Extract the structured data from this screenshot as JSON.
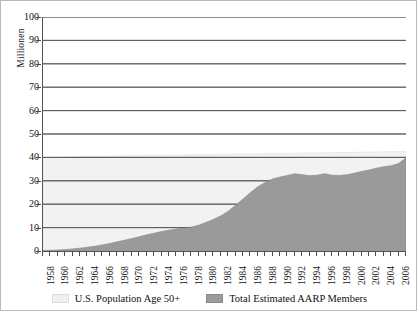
{
  "chart_data": {
    "type": "area",
    "title": "",
    "xlabel": "",
    "ylabel": "Millionen",
    "ylim": [
      0,
      100
    ],
    "xlim": [
      1958,
      2007
    ],
    "ytick_step": 10,
    "yticks": [
      0,
      10,
      20,
      30,
      40,
      50,
      60,
      70,
      80,
      90,
      100
    ],
    "xticks": [
      1958,
      1960,
      1962,
      1964,
      1966,
      1968,
      1970,
      1972,
      1974,
      1976,
      1978,
      1980,
      1982,
      1984,
      1986,
      1988,
      1990,
      1992,
      1994,
      1996,
      1998,
      2000,
      2002,
      2004,
      2006
    ],
    "xtick_labels": [
      "1958",
      "1960",
      "1962",
      "1964",
      "1966",
      "1968",
      "1970",
      "1972",
      "1974",
      "1976",
      "1978",
      "1980",
      "1982",
      "1984",
      "1986",
      "1988",
      "1990",
      "1992",
      "1994",
      "1996",
      "1998",
      "2000",
      "2002",
      "2004",
      "2006"
    ],
    "grid": "horizontal",
    "legend_position": "bottom",
    "x": [
      1958,
      1959,
      1960,
      1961,
      1962,
      1963,
      1964,
      1965,
      1966,
      1967,
      1968,
      1969,
      1970,
      1971,
      1972,
      1973,
      1974,
      1975,
      1976,
      1977,
      1978,
      1979,
      1980,
      1981,
      1982,
      1983,
      1984,
      1985,
      1986,
      1987,
      1988,
      1989,
      1990,
      1991,
      1992,
      1993,
      1994,
      1995,
      1996,
      1997,
      1998,
      1999,
      2000,
      2001,
      2002,
      2003,
      2004,
      2005,
      2006,
      2007
    ],
    "series": [
      {
        "name": "U.S. Population Age 50+",
        "color": "#f2f2f2",
        "values": [
          39.8,
          39.9,
          40.0,
          40.1,
          40.2,
          40.3,
          40.4,
          40.4,
          40.5,
          40.5,
          40.6,
          40.6,
          40.7,
          40.7,
          40.8,
          40.8,
          40.9,
          40.9,
          41.0,
          41.0,
          41.1,
          41.1,
          41.2,
          41.2,
          41.3,
          41.3,
          41.4,
          41.4,
          41.5,
          41.5,
          41.6,
          41.6,
          41.7,
          41.7,
          41.8,
          41.8,
          41.9,
          41.9,
          42.0,
          42.0,
          42.1,
          42.1,
          42.2,
          42.2,
          42.3,
          42.3,
          42.4,
          42.4,
          42.5,
          42.5
        ]
      },
      {
        "name": "Total Estimated AARP Members",
        "color": "#9a9a9a",
        "values": [
          0.2,
          0.3,
          0.4,
          0.6,
          0.9,
          1.2,
          1.6,
          2.0,
          2.6,
          3.2,
          3.9,
          4.6,
          5.3,
          6.1,
          6.9,
          7.6,
          8.3,
          8.9,
          9.4,
          9.8,
          10.2,
          11.0,
          12.2,
          13.5,
          15.0,
          17.0,
          19.5,
          22.2,
          25.0,
          27.5,
          29.3,
          30.8,
          31.6,
          32.3,
          33.0,
          32.6,
          32.2,
          32.4,
          33.0,
          32.4,
          32.3,
          32.6,
          33.2,
          34.0,
          34.6,
          35.4,
          36.0,
          36.4,
          37.4,
          39.8
        ]
      }
    ]
  },
  "legend": {
    "items": [
      {
        "label": "U.S. Population Age 50+",
        "swatch": "#f0f0f0",
        "swatch_border": "#dcdcdc"
      },
      {
        "label": "Total Estimated AARP Members",
        "swatch": "#9a9a9a",
        "swatch_border": "#8a8a8a"
      }
    ]
  },
  "colors": {
    "grid": "#5a5a5a",
    "axis": "#4a4a4a",
    "background": "#ffffff",
    "border": "#b9b9b9",
    "text": "#111111"
  }
}
